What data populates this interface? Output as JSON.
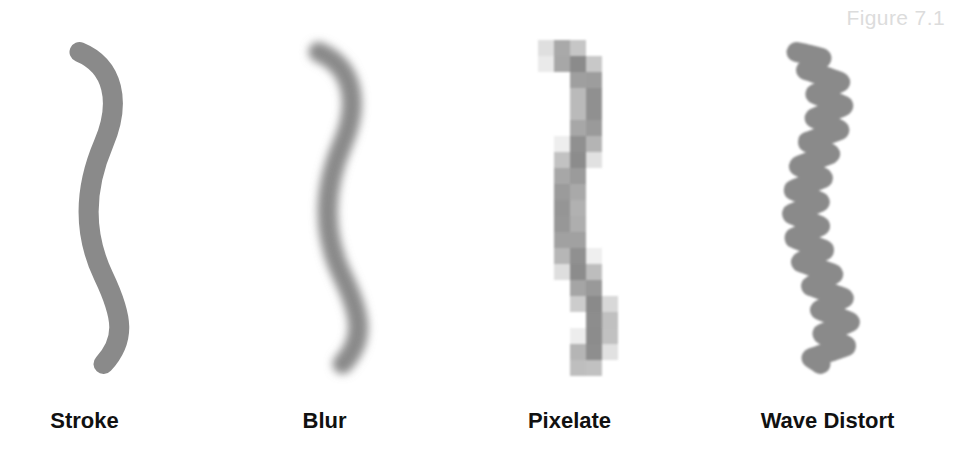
{
  "figure": {
    "caption": "Figure 7.1",
    "caption_color": "#dcdcdc",
    "background": "#ffffff",
    "width": 957,
    "height": 461
  },
  "stroke_style": {
    "color": "#8a8a8a",
    "width": 20,
    "linecap": "round",
    "path": "M 20 12 C 54 26, 62 62, 44 104 C 26 146, 22 190, 44 236 C 64 278, 66 300, 44 324"
  },
  "panels": [
    {
      "id": "stroke",
      "label": "Stroke",
      "effect": "none",
      "description": "crisp vector s-curve stroke"
    },
    {
      "id": "blur",
      "label": "Blur",
      "effect": "gaussian-blur",
      "blur_radius": 7,
      "description": "same s-curve with gaussian blur applied"
    },
    {
      "id": "pixelate",
      "label": "Pixelate",
      "effect": "pixelate",
      "block_size": 16,
      "description": "same s-curve quantized into square blocks"
    },
    {
      "id": "wave",
      "label": "Wave Distort",
      "effect": "wave-distort",
      "wave_amplitude": 14,
      "wave_cycles": 13,
      "description": "same s-curve with horizontal zigzag displacement"
    }
  ]
}
